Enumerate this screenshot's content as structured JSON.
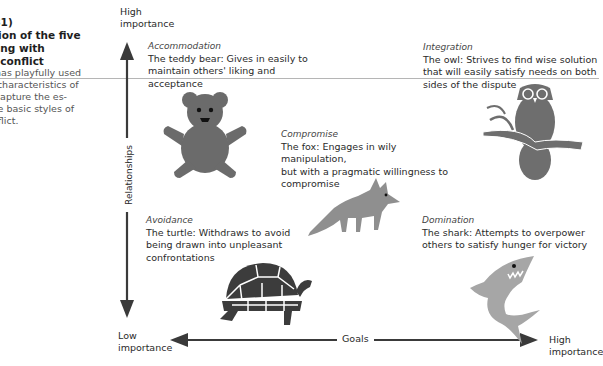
{
  "sidebar": {
    "title_lines": [
      "981)",
      "ation of the five",
      "aling with",
      "al conflict"
    ],
    "caption_lines": [
      "h has playfully used",
      "ic characteristics of",
      "o capture the es-",
      "five basic styles of",
      "onflict."
    ]
  },
  "axes": {
    "y_top_label": [
      "High",
      "importance"
    ],
    "y_bottom_label": [
      "Low",
      "importance"
    ],
    "y_title": "Relationships",
    "x_right_label": [
      "High",
      "importance"
    ],
    "x_title": "Goals"
  },
  "styles": [
    {
      "id": "accommodation",
      "name": "Accommodation",
      "lines": [
        "The teddy bear: Gives in easily to",
        "maintain others' liking and",
        "acceptance"
      ],
      "animal": "teddy-bear"
    },
    {
      "id": "integration",
      "name": "Integration",
      "lines": [
        "The owl: Strives to find wise solution",
        "that will easily satisfy needs on both",
        "sides of the dispute"
      ],
      "animal": "owl"
    },
    {
      "id": "compromise",
      "name": "Compromise",
      "lines": [
        "The fox: Engages in wily manipulation,",
        "but with a pragmatic willingness to",
        "compromise"
      ],
      "animal": "fox"
    },
    {
      "id": "avoidance",
      "name": "Avoidance",
      "lines": [
        "The turtle: Withdraws to avoid",
        "being drawn into unpleasant",
        "confrontations"
      ],
      "animal": "turtle"
    },
    {
      "id": "domination",
      "name": "Domination",
      "lines": [
        "The shark: Attempts to overpower",
        "others to satisfy hunger for victory"
      ],
      "animal": "shark"
    }
  ],
  "colors": {
    "axis": "#3a3a3a",
    "bear": "#6b6b6b",
    "owl": "#6e6e6e",
    "fox": "#8f8f8f",
    "turtle": "#3c3c3c",
    "shark": "#a6a6a6",
    "rule": "#b5b5b5"
  }
}
